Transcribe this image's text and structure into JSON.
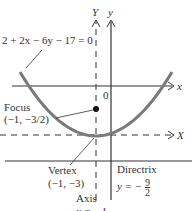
{
  "equation": "2 + 2x − 6y − 17 = 0",
  "axes": {
    "Y": "Y",
    "y": "y",
    "x": "x",
    "X": "X",
    "origin": "0"
  },
  "focus": {
    "label": "Focus",
    "coords": "(−1, −3/2)"
  },
  "vertex": {
    "label": "Vertex",
    "coords": "(−1, −3)"
  },
  "directrix": {
    "label": "Directrix",
    "eq_lhs": "y = −",
    "num": "9",
    "den": "2"
  },
  "axis": {
    "label": "Axis",
    "eq": "x = −1"
  },
  "colors": {
    "curve": "#7a7a7a",
    "lines": "#333333"
  }
}
